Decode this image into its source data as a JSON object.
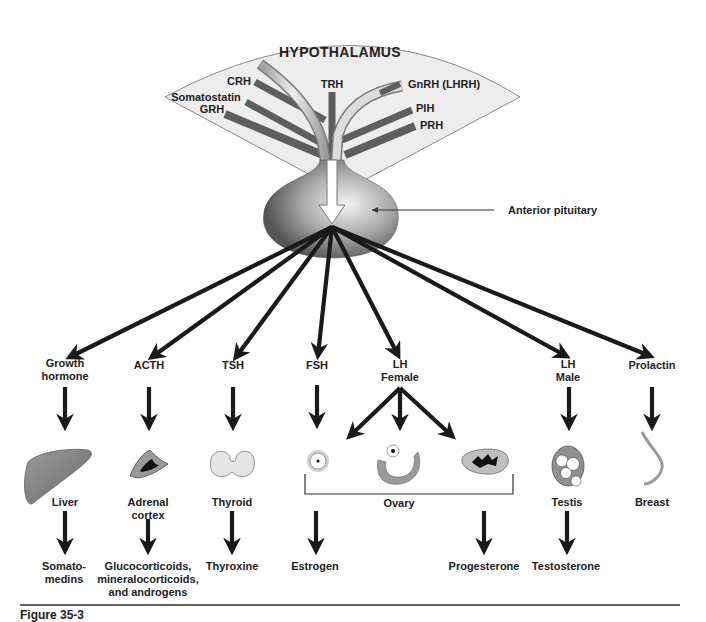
{
  "hypothalamus": {
    "title": "HYPOTHALAMUS",
    "releasing_hormones": [
      "CRH",
      "Somatostatin",
      "GRH",
      "TRH",
      "GnRH (LHRH)",
      "PIH",
      "PRH"
    ]
  },
  "pituitary": {
    "label": "Anterior pituitary"
  },
  "hormones": [
    {
      "id": "gh",
      "label_line1": "Growth",
      "label_line2": "hormone",
      "target": "Liver",
      "target_line2": "",
      "product_line1": "Somato-",
      "product_line2": "medins",
      "product_line3": ""
    },
    {
      "id": "acth",
      "label_line1": "ACTH",
      "label_line2": "",
      "target": "Adrenal",
      "target_line2": "cortex",
      "product_line1": "Glucocorticoids,",
      "product_line2": "mineralocorticoids,",
      "product_line3": "and androgens"
    },
    {
      "id": "tsh",
      "label_line1": "TSH",
      "label_line2": "",
      "target": "Thyroid",
      "target_line2": "",
      "product_line1": "Thyroxine",
      "product_line2": "",
      "product_line3": ""
    },
    {
      "id": "fsh",
      "label_line1": "FSH",
      "label_line2": "",
      "target": "",
      "target_line2": "",
      "product_line1": "Estrogen",
      "product_line2": "",
      "product_line3": ""
    },
    {
      "id": "lh-female",
      "label_line1": "LH",
      "label_line2": "Female",
      "target": "",
      "target_line2": "",
      "product_line1": "Progesterone",
      "product_line2": "",
      "product_line3": ""
    },
    {
      "id": "lh-male",
      "label_line1": "LH",
      "label_line2": "Male",
      "target": "Testis",
      "target_line2": "",
      "product_line1": "Testosterone",
      "product_line2": "",
      "product_line3": ""
    },
    {
      "id": "prolactin",
      "label_line1": "Prolactin",
      "label_line2": "",
      "target": "Breast",
      "target_line2": "",
      "product_line1": "",
      "product_line2": "",
      "product_line3": ""
    }
  ],
  "ovary": {
    "label": "Ovary"
  },
  "caption": "Figure 35-3",
  "colors": {
    "arrow": "#1a1a1a",
    "hypothalamus_fill": "#ededed",
    "hypothalamus_stroke": "#8a8a8a",
    "tract_dark": "#5a5a5a",
    "tract_light": "#d6d6d6"
  }
}
